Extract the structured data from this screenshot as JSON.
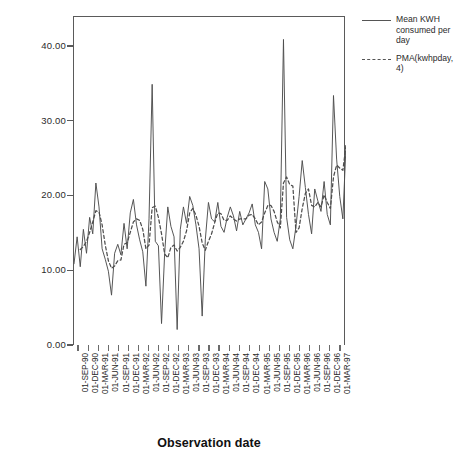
{
  "chart_data": {
    "type": "line",
    "title": "",
    "xlabel": "Observation date",
    "ylabel": "",
    "ylim": [
      0,
      44
    ],
    "ytick_values": [
      0,
      10,
      20,
      30,
      40
    ],
    "ytick_labels": [
      "0.00",
      "10.00",
      "20.00",
      "30.00",
      "40.00"
    ],
    "grid": false,
    "legend_position": "right",
    "x_tick_labels": [
      "01-SEP-90",
      "01-DEC-90",
      "01-MAR-91",
      "01-JUN-91",
      "01-SEP-91",
      "01-DEC-91",
      "01-MAR-92",
      "01-JUN-92",
      "01-SEP-92",
      "01-DEC-92",
      "01-MAR-93",
      "01-JUN-93",
      "01-SEP-93",
      "01-DEC-93",
      "01-MAR-94",
      "01-JUN-94",
      "01-SEP-94",
      "01-DEC-94",
      "01-MAR-95",
      "01-JUN-95",
      "01-SEP-95",
      "01-DEC-95",
      "01-MAR-96",
      "01-JUN-96",
      "01-SEP-96",
      "01-DEC-96",
      "01-MAR-97"
    ],
    "series": [
      {
        "name": "Mean KWH consumed per day",
        "style": "solid",
        "color": "#4d4d4d",
        "values": [
          11.0,
          14.6,
          10.6,
          15.6,
          12.4,
          17.2,
          15.0,
          21.8,
          18.6,
          13.0,
          11.6,
          10.0,
          6.8,
          12.4,
          13.6,
          12.2,
          16.4,
          13.0,
          17.8,
          19.6,
          16.2,
          14.2,
          12.6,
          8.0,
          17.0,
          35.0,
          14.0,
          13.4,
          3.0,
          12.4,
          18.6,
          16.0,
          14.6,
          2.2,
          15.6,
          18.6,
          16.4,
          20.0,
          18.8,
          16.2,
          13.0,
          4.0,
          14.2,
          19.2,
          17.0,
          16.6,
          19.2,
          16.0,
          15.2,
          17.2,
          18.6,
          17.4,
          15.4,
          18.0,
          16.2,
          17.0,
          17.8,
          19.0,
          16.2,
          15.2,
          13.0,
          22.0,
          21.0,
          17.0,
          15.2,
          14.0,
          17.0,
          41.0,
          17.2,
          14.2,
          13.0,
          16.0,
          20.0,
          24.8,
          21.2,
          17.6,
          15.0,
          21.0,
          19.4,
          18.0,
          22.0,
          17.6,
          16.2,
          33.5,
          25.0,
          20.0,
          17.0,
          26.8
        ]
      },
      {
        "name": "PMA(kwhpday, 4)",
        "style": "dashed",
        "color": "#4d4d4d",
        "values": [
          null,
          null,
          12.9,
          13.3,
          14.0,
          15.2,
          16.6,
          18.1,
          17.9,
          16.2,
          13.5,
          11.4,
          10.4,
          10.7,
          11.4,
          11.5,
          13.6,
          13.8,
          15.2,
          16.6,
          17.0,
          16.8,
          15.6,
          13.0,
          13.5,
          18.5,
          18.7,
          17.2,
          15.0,
          12.3,
          11.8,
          13.2,
          13.5,
          12.7,
          13.2,
          14.0,
          15.4,
          17.8,
          18.4,
          17.5,
          16.0,
          13.8,
          12.8,
          14.0,
          15.0,
          16.5,
          17.8,
          17.7,
          16.8,
          16.8,
          17.4,
          17.0,
          16.7,
          17.0,
          17.0,
          17.0,
          17.5,
          17.6,
          17.0,
          16.2,
          16.6,
          17.8,
          18.8,
          18.8,
          18.0,
          16.6,
          15.8,
          21.8,
          22.6,
          21.6,
          21.4,
          15.2,
          15.8,
          18.4,
          20.4,
          21.0,
          18.8,
          18.6,
          19.2,
          18.6,
          20.2,
          19.2,
          18.4,
          22.6,
          24.2,
          23.8,
          23.5,
          26.8
        ]
      }
    ]
  },
  "axes": {
    "x_title": "Observation date"
  },
  "legend": {
    "items": [
      {
        "label": "Mean KWH consumed per day",
        "style": "solid"
      },
      {
        "label": "PMA(kwhpday, 4)",
        "style": "dashed"
      }
    ]
  }
}
